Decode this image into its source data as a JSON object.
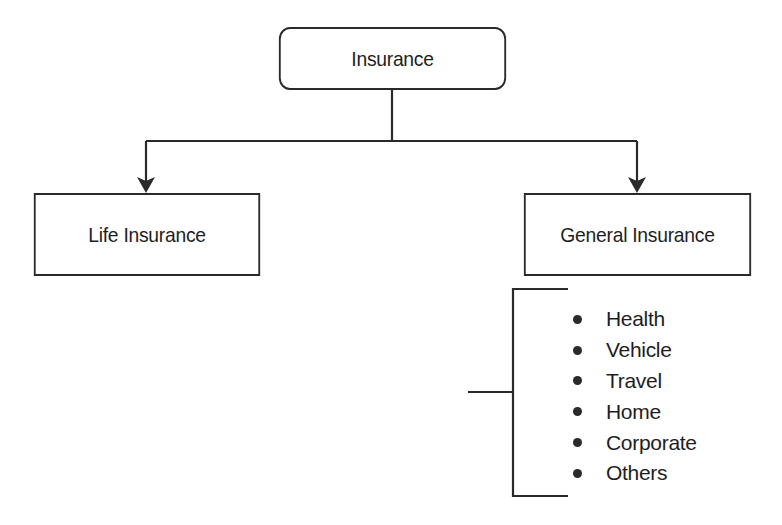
{
  "diagram": {
    "type": "hierarchy",
    "root": {
      "label": "Insurance"
    },
    "children": [
      {
        "label": "Life Insurance"
      },
      {
        "label": "General Insurance"
      }
    ],
    "general_insurance_types": [
      {
        "label": "Health"
      },
      {
        "label": "Vehicle"
      },
      {
        "label": "Travel"
      },
      {
        "label": "Home"
      },
      {
        "label": "Corporate"
      },
      {
        "label": "Others"
      }
    ],
    "colors": {
      "line": "#2a2a2a",
      "text": "#1e1e1e",
      "background": "#ffffff"
    }
  }
}
